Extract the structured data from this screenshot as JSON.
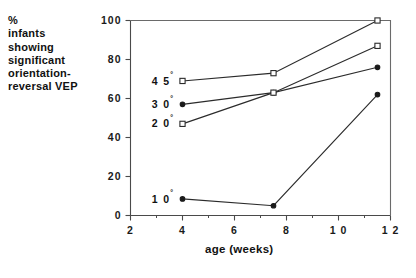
{
  "chart_data": {
    "type": "line",
    "title": "",
    "ylabel": "% infants showing significant orientation-reversal VEP",
    "xlabel": "age  (weeks)",
    "xlim": [
      2,
      12
    ],
    "ylim": [
      0,
      100
    ],
    "xticks": [
      2,
      4,
      6,
      8,
      10,
      12
    ],
    "xticklabels": [
      "2",
      "4",
      "6",
      "8",
      "1 0",
      "1 2"
    ],
    "yticks": [
      0,
      20,
      40,
      60,
      80,
      100
    ],
    "yticklabels": [
      "0",
      "20",
      "40",
      "60",
      "80",
      "100"
    ],
    "xminorticks": [
      3,
      5,
      7,
      9,
      11
    ],
    "grid": false,
    "legend_position": "inline-left-of-first-point",
    "series": [
      {
        "name": "45",
        "label": "4 5",
        "unit": "°",
        "marker": "open-square",
        "x": [
          4,
          7.5,
          11.5
        ],
        "values": [
          69,
          73,
          100
        ]
      },
      {
        "name": "30",
        "label": "3 0",
        "unit": "°",
        "marker": "filled-circle",
        "x": [
          4,
          7.5,
          11.5
        ],
        "values": [
          57,
          63,
          76
        ]
      },
      {
        "name": "20",
        "label": "2 0",
        "unit": "°",
        "marker": "open-square",
        "x": [
          4,
          7.5,
          11.5
        ],
        "values": [
          47,
          63,
          87
        ]
      },
      {
        "name": "10",
        "label": "1 0",
        "unit": "°",
        "marker": "filled-circle",
        "x": [
          4,
          7.5,
          11.5
        ],
        "values": [
          8.5,
          5,
          62
        ]
      }
    ]
  },
  "ylabel_lines": [
    "%",
    "infants",
    "showing",
    "significant",
    "orientation-",
    "reversal  VEP"
  ],
  "axis_title": {
    "x": "age  (weeks)"
  },
  "colors": {
    "background": "#ffffff",
    "axis": "#4a4a4a",
    "data": "#2b2b2b",
    "text": "#111111"
  }
}
